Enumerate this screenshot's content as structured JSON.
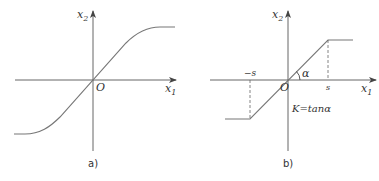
{
  "figure": {
    "panels": [
      {
        "id": "a",
        "caption": "a)",
        "x_axis_label": "x",
        "x_axis_sub": "1",
        "y_axis_label": "x",
        "y_axis_sub": "2",
        "origin_label": "O",
        "curve_type": "smooth saturation (sigmoid-like)"
      },
      {
        "id": "b",
        "caption": "b)",
        "x_axis_label": "x",
        "x_axis_sub": "1",
        "y_axis_label": "x",
        "y_axis_sub": "2",
        "origin_label": "O",
        "neg_threshold_label": "−s",
        "pos_threshold_label": "s",
        "angle_label": "α",
        "gain_formula": "K=tanα",
        "curve_type": "piecewise linear saturation"
      }
    ],
    "colors": {
      "line": "#555555",
      "text": "#333333",
      "background": "#ffffff"
    }
  }
}
